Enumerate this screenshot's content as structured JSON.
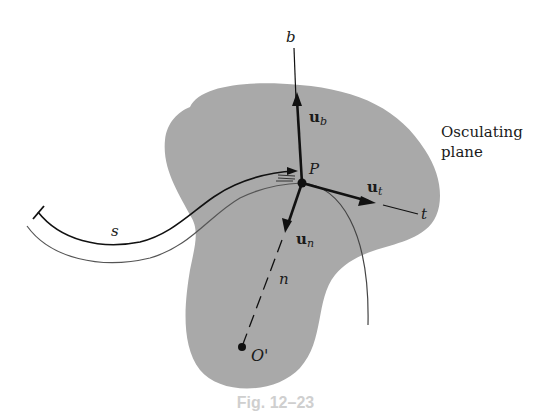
{
  "figure": {
    "type": "diagram",
    "colors": {
      "plane_fill": "#a9a9a9",
      "ink": "#111111",
      "curve_gray": "#555555",
      "background": "#ffffff"
    },
    "labels": {
      "binormal_axis": "b",
      "binormal_unit_vector": "u",
      "binormal_subscript": "b",
      "tangent_axis": "t",
      "tangent_unit_vector": "u",
      "tangent_subscript": "t",
      "normal_axis": "n",
      "normal_unit_vector": "u",
      "normal_subscript": "n",
      "point": "P",
      "center_of_curvature": "O'",
      "arc_length": "s",
      "plane_label_line1": "Osculating",
      "plane_label_line2": "plane"
    },
    "caption": "Fig. 12–23"
  }
}
